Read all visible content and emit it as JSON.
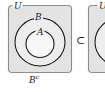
{
  "figure": {
    "kind": "venn-diagram",
    "colors": {
      "box_fill": "#e3e3e3",
      "box_stroke": "#8c8c8c",
      "curve_stroke": "#1a1a1a",
      "inner_fill": "#f7f7f7",
      "middle_fill": "#ededed",
      "page_background": "#fefefe",
      "text": "#1a1a1a"
    },
    "labels": {
      "universe": "U",
      "outer_set": "B",
      "inner_set": "A",
      "complement_base": "B",
      "complement_exponent": "c",
      "relation": "⊂",
      "universe_second": "U"
    },
    "panels": [
      {
        "name": "left-panel",
        "universe_label": "U",
        "sets": [
          {
            "name": "B",
            "label": "B",
            "role": "outer-ellipse"
          },
          {
            "name": "A",
            "label": "A",
            "role": "inner-ellipse"
          }
        ],
        "caption": "Bᶜ",
        "caption_meaning": "complement of B"
      },
      {
        "name": "right-panel",
        "universe_label": "U",
        "clipped": true,
        "sets": [
          {
            "name": "outer",
            "label": "",
            "role": "outer-ellipse"
          }
        ]
      }
    ],
    "relation_between_panels": "⊂"
  }
}
